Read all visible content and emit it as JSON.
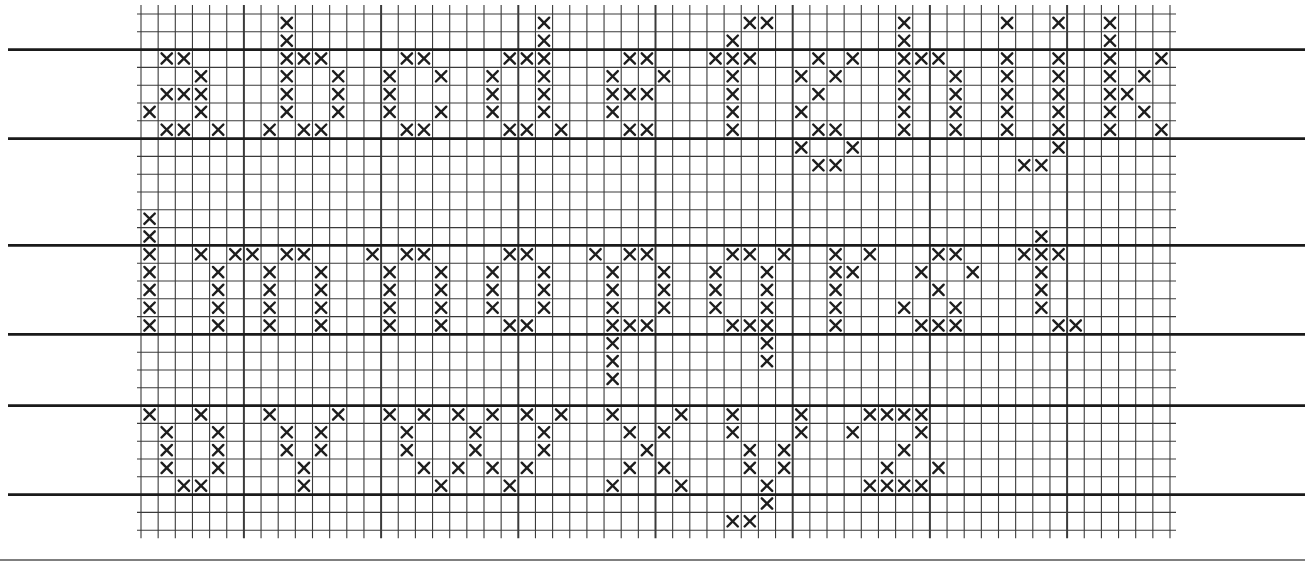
{
  "sheet": {
    "title": "Cross-stitch lowercase alphabet chart",
    "alphabet_rows": [
      "abcdefghijk",
      "lmnopqrst",
      "uvwxyz"
    ],
    "colors": {
      "paper": "#ffffff",
      "grid": "#3a3a3a",
      "guide": "#1a1a1a",
      "stitch": "#1e1e1e"
    }
  },
  "grid": {
    "origin_x": 141,
    "origin_y": 14,
    "cell_w": 17.15,
    "cell_h": 17.8,
    "cols": 60,
    "rows": 29,
    "major_every": 8,
    "major_offset": 6,
    "guide_rows": [
      2,
      7,
      13,
      18,
      22,
      27
    ],
    "guide_left": 8,
    "guide_right": 1305,
    "bottom_rule_y": 560
  },
  "letters": [
    {
      "char": "a",
      "stitches": [
        [
          2,
          1
        ],
        [
          2,
          2
        ],
        [
          3,
          3
        ],
        [
          4,
          1
        ],
        [
          4,
          2
        ],
        [
          4,
          3
        ],
        [
          5,
          0
        ],
        [
          5,
          3
        ],
        [
          6,
          1
        ],
        [
          6,
          2
        ],
        [
          6,
          4
        ]
      ]
    },
    {
      "char": "b",
      "stitches": [
        [
          0,
          8
        ],
        [
          1,
          8
        ],
        [
          2,
          8
        ],
        [
          2,
          9
        ],
        [
          2,
          10
        ],
        [
          3,
          8
        ],
        [
          3,
          11
        ],
        [
          4,
          8
        ],
        [
          4,
          11
        ],
        [
          5,
          8
        ],
        [
          5,
          11
        ],
        [
          6,
          7
        ],
        [
          6,
          9
        ],
        [
          6,
          10
        ]
      ]
    },
    {
      "char": "c",
      "stitches": [
        [
          2,
          15
        ],
        [
          2,
          16
        ],
        [
          3,
          14
        ],
        [
          3,
          17
        ],
        [
          4,
          14
        ],
        [
          5,
          14
        ],
        [
          5,
          17
        ],
        [
          6,
          15
        ],
        [
          6,
          16
        ]
      ]
    },
    {
      "char": "d",
      "stitches": [
        [
          0,
          23
        ],
        [
          1,
          23
        ],
        [
          2,
          21
        ],
        [
          2,
          22
        ],
        [
          2,
          23
        ],
        [
          3,
          20
        ],
        [
          3,
          23
        ],
        [
          4,
          20
        ],
        [
          4,
          23
        ],
        [
          5,
          20
        ],
        [
          5,
          23
        ],
        [
          6,
          21
        ],
        [
          6,
          22
        ],
        [
          6,
          24
        ]
      ]
    },
    {
      "char": "e",
      "stitches": [
        [
          2,
          28
        ],
        [
          2,
          29
        ],
        [
          3,
          27
        ],
        [
          3,
          30
        ],
        [
          4,
          27
        ],
        [
          4,
          28
        ],
        [
          4,
          29
        ],
        [
          5,
          27
        ],
        [
          6,
          28
        ],
        [
          6,
          29
        ]
      ]
    },
    {
      "char": "f",
      "stitches": [
        [
          0,
          35
        ],
        [
          0,
          36
        ],
        [
          1,
          34
        ],
        [
          2,
          33
        ],
        [
          2,
          34
        ],
        [
          2,
          35
        ],
        [
          3,
          34
        ],
        [
          4,
          34
        ],
        [
          5,
          34
        ],
        [
          6,
          34
        ]
      ]
    },
    {
      "char": "g",
      "stitches": [
        [
          2,
          39
        ],
        [
          2,
          41
        ],
        [
          3,
          38
        ],
        [
          3,
          40
        ],
        [
          4,
          39
        ],
        [
          5,
          38
        ],
        [
          6,
          39
        ],
        [
          6,
          40
        ],
        [
          7,
          38
        ],
        [
          7,
          41
        ],
        [
          8,
          39
        ],
        [
          8,
          40
        ]
      ]
    },
    {
      "char": "h",
      "stitches": [
        [
          0,
          44
        ],
        [
          1,
          44
        ],
        [
          2,
          44
        ],
        [
          2,
          45
        ],
        [
          2,
          46
        ],
        [
          3,
          44
        ],
        [
          3,
          47
        ],
        [
          4,
          44
        ],
        [
          4,
          47
        ],
        [
          5,
          44
        ],
        [
          5,
          47
        ],
        [
          6,
          44
        ],
        [
          6,
          47
        ]
      ]
    },
    {
      "char": "i",
      "stitches": [
        [
          0,
          50
        ],
        [
          2,
          50
        ],
        [
          3,
          50
        ],
        [
          4,
          50
        ],
        [
          5,
          50
        ],
        [
          6,
          50
        ]
      ]
    },
    {
      "char": "j",
      "stitches": [
        [
          0,
          53
        ],
        [
          2,
          53
        ],
        [
          3,
          53
        ],
        [
          4,
          53
        ],
        [
          5,
          53
        ],
        [
          6,
          53
        ],
        [
          7,
          53
        ],
        [
          8,
          51
        ],
        [
          8,
          52
        ]
      ]
    },
    {
      "char": "k",
      "stitches": [
        [
          0,
          56
        ],
        [
          1,
          56
        ],
        [
          2,
          56
        ],
        [
          2,
          59
        ],
        [
          3,
          56
        ],
        [
          3,
          58
        ],
        [
          4,
          56
        ],
        [
          4,
          57
        ],
        [
          5,
          56
        ],
        [
          5,
          58
        ],
        [
          6,
          56
        ],
        [
          6,
          59
        ]
      ]
    },
    {
      "char": "l",
      "stitches": [
        [
          11,
          0
        ],
        [
          12,
          0
        ],
        [
          13,
          0
        ],
        [
          14,
          0
        ],
        [
          15,
          0
        ],
        [
          16,
          0
        ],
        [
          17,
          0
        ]
      ]
    },
    {
      "char": "m",
      "stitches": [
        [
          13,
          3
        ],
        [
          13,
          5
        ],
        [
          13,
          6
        ],
        [
          13,
          8
        ],
        [
          13,
          9
        ],
        [
          14,
          4
        ],
        [
          14,
          7
        ],
        [
          14,
          10
        ],
        [
          15,
          4
        ],
        [
          15,
          7
        ],
        [
          15,
          10
        ],
        [
          16,
          4
        ],
        [
          16,
          7
        ],
        [
          16,
          10
        ],
        [
          17,
          4
        ],
        [
          17,
          7
        ],
        [
          17,
          10
        ]
      ]
    },
    {
      "char": "n",
      "stitches": [
        [
          13,
          13
        ],
        [
          13,
          15
        ],
        [
          13,
          16
        ],
        [
          14,
          14
        ],
        [
          14,
          17
        ],
        [
          15,
          14
        ],
        [
          15,
          17
        ],
        [
          16,
          14
        ],
        [
          16,
          17
        ],
        [
          17,
          14
        ],
        [
          17,
          17
        ]
      ]
    },
    {
      "char": "o",
      "stitches": [
        [
          13,
          21
        ],
        [
          13,
          22
        ],
        [
          14,
          20
        ],
        [
          14,
          23
        ],
        [
          15,
          20
        ],
        [
          15,
          23
        ],
        [
          16,
          20
        ],
        [
          16,
          23
        ],
        [
          17,
          21
        ],
        [
          17,
          22
        ]
      ]
    },
    {
      "char": "p",
      "stitches": [
        [
          13,
          26
        ],
        [
          13,
          28
        ],
        [
          13,
          29
        ],
        [
          14,
          27
        ],
        [
          14,
          30
        ],
        [
          15,
          27
        ],
        [
          15,
          30
        ],
        [
          16,
          27
        ],
        [
          16,
          30
        ],
        [
          17,
          27
        ],
        [
          17,
          28
        ],
        [
          17,
          29
        ],
        [
          18,
          27
        ],
        [
          19,
          27
        ],
        [
          20,
          27
        ]
      ]
    },
    {
      "char": "q",
      "stitches": [
        [
          13,
          34
        ],
        [
          13,
          35
        ],
        [
          13,
          37
        ],
        [
          14,
          33
        ],
        [
          14,
          36
        ],
        [
          15,
          33
        ],
        [
          15,
          36
        ],
        [
          16,
          33
        ],
        [
          16,
          36
        ],
        [
          17,
          34
        ],
        [
          17,
          35
        ],
        [
          17,
          36
        ],
        [
          18,
          36
        ],
        [
          19,
          36
        ]
      ]
    },
    {
      "char": "r",
      "stitches": [
        [
          13,
          40
        ],
        [
          13,
          42
        ],
        [
          14,
          40
        ],
        [
          14,
          41
        ],
        [
          15,
          40
        ],
        [
          16,
          40
        ],
        [
          17,
          40
        ]
      ]
    },
    {
      "char": "s",
      "stitches": [
        [
          13,
          46
        ],
        [
          13,
          47
        ],
        [
          14,
          45
        ],
        [
          14,
          48
        ],
        [
          15,
          46
        ],
        [
          16,
          44
        ],
        [
          16,
          47
        ],
        [
          17,
          45
        ],
        [
          17,
          46
        ],
        [
          17,
          47
        ]
      ]
    },
    {
      "char": "t",
      "stitches": [
        [
          12,
          52
        ],
        [
          13,
          51
        ],
        [
          13,
          52
        ],
        [
          13,
          53
        ],
        [
          14,
          52
        ],
        [
          15,
          52
        ],
        [
          16,
          52
        ],
        [
          17,
          53
        ],
        [
          17,
          54
        ]
      ]
    },
    {
      "char": "u",
      "stitches": [
        [
          22,
          0
        ],
        [
          22,
          3
        ],
        [
          23,
          1
        ],
        [
          23,
          4
        ],
        [
          24,
          1
        ],
        [
          24,
          4
        ],
        [
          25,
          1
        ],
        [
          25,
          4
        ],
        [
          26,
          2
        ],
        [
          26,
          3
        ]
      ]
    },
    {
      "char": "v",
      "stitches": [
        [
          22,
          7
        ],
        [
          22,
          11
        ],
        [
          23,
          8
        ],
        [
          23,
          10
        ],
        [
          24,
          8
        ],
        [
          24,
          10
        ],
        [
          25,
          9
        ],
        [
          26,
          9
        ]
      ]
    },
    {
      "char": "w",
      "stitches": [
        [
          22,
          14
        ],
        [
          22,
          16
        ],
        [
          22,
          18
        ],
        [
          22,
          20
        ],
        [
          22,
          22
        ],
        [
          22,
          24
        ],
        [
          23,
          15
        ],
        [
          23,
          19
        ],
        [
          23,
          23
        ],
        [
          24,
          15
        ],
        [
          24,
          19
        ],
        [
          24,
          23
        ],
        [
          25,
          16
        ],
        [
          25,
          18
        ],
        [
          25,
          20
        ],
        [
          25,
          22
        ],
        [
          26,
          17
        ],
        [
          26,
          21
        ]
      ]
    },
    {
      "char": "x",
      "stitches": [
        [
          22,
          27
        ],
        [
          22,
          31
        ],
        [
          23,
          28
        ],
        [
          23,
          30
        ],
        [
          24,
          29
        ],
        [
          25,
          28
        ],
        [
          25,
          30
        ],
        [
          26,
          27
        ],
        [
          26,
          31
        ]
      ]
    },
    {
      "char": "y",
      "stitches": [
        [
          22,
          34
        ],
        [
          22,
          38
        ],
        [
          23,
          34
        ],
        [
          23,
          38
        ],
        [
          24,
          35
        ],
        [
          24,
          37
        ],
        [
          25,
          35
        ],
        [
          25,
          37
        ],
        [
          26,
          36
        ],
        [
          27,
          36
        ],
        [
          28,
          34
        ],
        [
          28,
          35
        ]
      ]
    },
    {
      "char": "z",
      "stitches": [
        [
          22,
          42
        ],
        [
          22,
          43
        ],
        [
          22,
          44
        ],
        [
          22,
          45
        ],
        [
          23,
          41
        ],
        [
          23,
          45
        ],
        [
          24,
          44
        ],
        [
          25,
          43
        ],
        [
          25,
          46
        ],
        [
          26,
          42
        ],
        [
          26,
          43
        ],
        [
          26,
          44
        ],
        [
          26,
          45
        ]
      ]
    }
  ]
}
